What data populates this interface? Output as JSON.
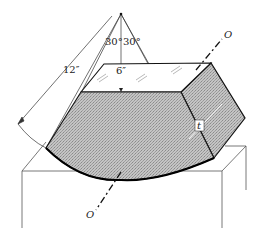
{
  "diagram": {
    "type": "engineering-figure",
    "labels": {
      "angle_left": "30°",
      "angle_right": "30°",
      "radius": "12″",
      "inner_height": "6″",
      "thickness": "t",
      "axis_top": "O",
      "axis_bottom": "O"
    },
    "colors": {
      "line": "#222222",
      "fill_shaded": "#b8b8b8",
      "fill_face": "#ffffff",
      "support_line": "#555555"
    }
  }
}
